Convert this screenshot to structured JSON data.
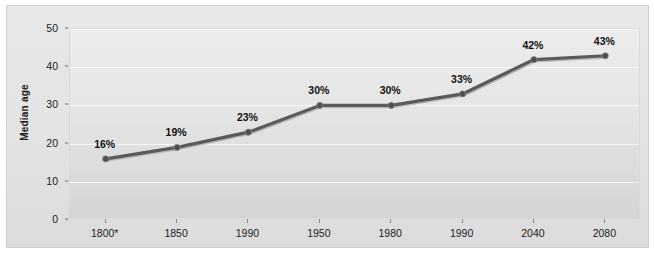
{
  "figure": {
    "caption_sliver": "",
    "background_color": "#ffffff",
    "panel_color": "#e5e5e5"
  },
  "chart_data": {
    "type": "line",
    "title": "",
    "subtitle": "",
    "xlabel": "",
    "ylabel": "Median age",
    "categories": [
      "1800*",
      "1850",
      "1990",
      "1950",
      "1980",
      "1990",
      "2040",
      "2080"
    ],
    "values": [
      16,
      19,
      23,
      30,
      30,
      33,
      42,
      43
    ],
    "point_labels": [
      "16%",
      "19%",
      "23%",
      "30%",
      "30%",
      "33%",
      "42%",
      "43%"
    ],
    "ylim": [
      0,
      50
    ],
    "y_ticks": [
      0,
      10,
      20,
      30,
      40,
      50
    ],
    "y_tick_labels": [
      "0",
      "10",
      "20",
      "30",
      "40",
      "50"
    ],
    "grid": true,
    "grid_color": "#f7f7f7",
    "legend": false,
    "legend_position": "none",
    "series": [
      {
        "name": "Median age",
        "values": [
          16,
          19,
          23,
          30,
          30,
          33,
          42,
          43
        ],
        "line_color": "#5a5a5a",
        "marker_color": "#4e4e4e",
        "marker": "circle"
      }
    ]
  }
}
